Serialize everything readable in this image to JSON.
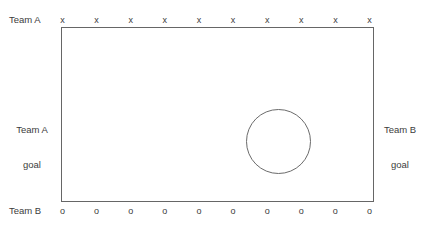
{
  "diagram": {
    "background_color": "#ffffff",
    "line_color": "#666666",
    "text_color": "#3c3c3c",
    "field": {
      "label": "playing field"
    },
    "center_circle": {
      "label": "center circle"
    },
    "top_row": {
      "team_label": "Team A",
      "marker_symbol": "x",
      "marker_count": 10,
      "markers": [
        "x",
        "x",
        "x",
        "x",
        "x",
        "x",
        "x",
        "x",
        "x",
        "x"
      ]
    },
    "bottom_row": {
      "team_label": "Team B",
      "marker_symbol": "o",
      "marker_count": 10,
      "markers": [
        "o",
        "o",
        "o",
        "o",
        "o",
        "o",
        "o",
        "o",
        "o",
        "o"
      ]
    },
    "left_goal": {
      "line1": "Team A",
      "line2": "goal"
    },
    "right_goal": {
      "line1": "Team B",
      "line2": "goal"
    }
  }
}
